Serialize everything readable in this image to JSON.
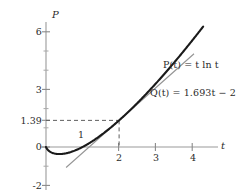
{
  "chart_data": {
    "type": "line",
    "title": "",
    "xlabel": "t",
    "ylabel": "P",
    "xlim": [
      -0.25,
      4.6
    ],
    "ylim": [
      -2.6,
      6.8
    ],
    "grid": false,
    "legend_position": "inline-annotations",
    "x_ticks": [
      {
        "value": 2,
        "label": "2"
      },
      {
        "value": 3,
        "label": "3"
      },
      {
        "value": 4,
        "label": "4"
      }
    ],
    "x_minor_ticks": [
      1
    ],
    "y_ticks": [
      {
        "value": 6,
        "label": "6"
      },
      {
        "value": 3,
        "label": "3"
      },
      {
        "value": 1.39,
        "label": "1.39"
      },
      {
        "value": 0,
        "label": "0"
      },
      {
        "value": -2,
        "label": "-2"
      }
    ],
    "y_minor_ticks": [
      5,
      4,
      2,
      1,
      -1
    ],
    "series": [
      {
        "name": "P(t) = t ln t",
        "expression": "t*ln(t)",
        "style": "solid-thick",
        "color": "#1a1a1a",
        "x_range": [
          0,
          4.3
        ],
        "points": [
          {
            "t": 0.0,
            "P": 0.0
          },
          {
            "t": 0.1,
            "P": -0.23
          },
          {
            "t": 0.2,
            "P": -0.322
          },
          {
            "t": 0.3,
            "P": -0.361
          },
          {
            "t": 0.368,
            "P": -0.368
          },
          {
            "t": 0.5,
            "P": -0.347
          },
          {
            "t": 0.7,
            "P": -0.25
          },
          {
            "t": 1.0,
            "P": 0.0
          },
          {
            "t": 1.5,
            "P": 0.608
          },
          {
            "t": 2.0,
            "P": 1.386
          },
          {
            "t": 2.5,
            "P": 2.291
          },
          {
            "t": 3.0,
            "P": 3.296
          },
          {
            "t": 3.5,
            "P": 4.385
          },
          {
            "t": 4.0,
            "P": 5.545
          },
          {
            "t": 4.3,
            "P": 6.274
          }
        ]
      },
      {
        "name": "Q(t) = 1.693t - 2",
        "expression": "1.693*t - 2",
        "style": "solid-thin",
        "color": "#8c8c8c",
        "x_range": [
          0.55,
          4.05
        ],
        "points": [
          {
            "t": 0.55,
            "P": -1.069
          },
          {
            "t": 2.0,
            "P": 1.386
          },
          {
            "t": 4.05,
            "P": 4.857
          }
        ]
      }
    ],
    "annotations": [
      {
        "name": "tangent-point-guide-horizontal",
        "type": "dashed-line",
        "from": {
          "t": 0,
          "P": 1.39
        },
        "to": {
          "t": 2,
          "P": 1.39
        }
      },
      {
        "name": "tangent-point-guide-vertical",
        "type": "dashed-line",
        "from": {
          "t": 2,
          "P": 1.39
        },
        "to": {
          "t": 2,
          "P": 0
        }
      },
      {
        "name": "label-one",
        "type": "text",
        "text": "1",
        "t": 1.0,
        "P": 0.52
      }
    ]
  },
  "axes": {
    "y_axis_label": "P",
    "x_axis_label": "t"
  },
  "tick_labels": {
    "y": [
      "6",
      "3",
      "1.39",
      "0",
      "-2"
    ],
    "x": [
      "2",
      "3",
      "4"
    ],
    "inline_one": "1"
  },
  "equations": {
    "p_curve": "P(t) = t ln t",
    "p_curve_parts": {
      "func": "P",
      "arg": "t",
      "rhs": "t ln t"
    },
    "q_line": "Q(t) = 1.693t − 2",
    "q_line_parts": {
      "func": "Q",
      "arg": "t",
      "slope": "1.693",
      "intercept": "−2"
    }
  },
  "colors": {
    "background": "#ffffff",
    "curve": "#1a1a1a",
    "tangent_line": "#8c8c8c",
    "axis": "#8a8a8a",
    "text": "#2b2b2b",
    "dashed_guide": "#6e6e6e"
  }
}
